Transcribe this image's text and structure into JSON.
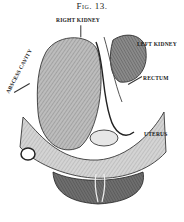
{
  "figure": {
    "title": "Fig. 13.",
    "labels": {
      "right_kidney": "RIGHT KIDNEY",
      "left_kidney": "LEFT KIDNEY",
      "rectum": "RECTUM",
      "uterus": "UTERUS",
      "abscess_cavity": "ABSCESS CAVITY"
    },
    "caption": ""
  },
  "colors": {
    "ink": "#1a1a1a",
    "background": "#ffffff"
  }
}
